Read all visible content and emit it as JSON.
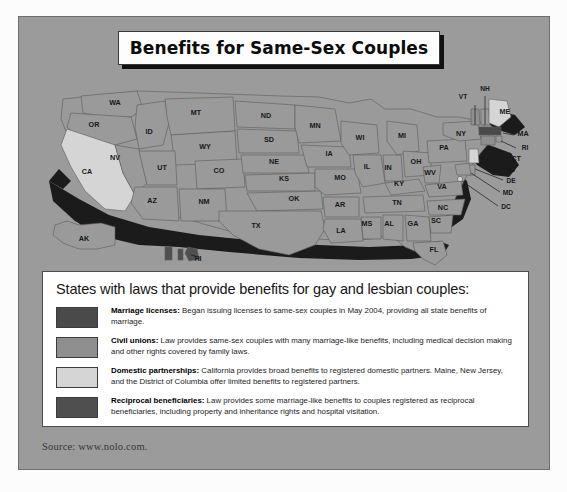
{
  "title": "Benefits for Same-Sex Couples",
  "source": "Source: www.nolo.com.",
  "colors": {
    "background": "#9b9b9b",
    "marriage": "#4a4a4a",
    "civil_union": "#8f8f8f",
    "domestic_partnership": "#d5d5d5",
    "reciprocal": "#4f4f4f",
    "default_state": "#9a9a9a",
    "shadow": "#1b1b1b",
    "border": "#4c4c4c"
  },
  "legend": {
    "heading": "States with laws that provide benefits for gay and lesbian couples:",
    "items": [
      {
        "swatch": "#4a4a4a",
        "term": "Marriage licenses:",
        "text": " Began issuing licenses to same-sex couples in May 2004, providing all state benefits of marriage."
      },
      {
        "swatch": "#8f8f8f",
        "term": "Civil unions:",
        "text": " Law provides same-sex couples with many marriage-like benefits, including medical decision making and other rights covered by family laws."
      },
      {
        "swatch": "#d5d5d5",
        "term": "Domestic partnerships:",
        "text": " California provides broad benefits to registered domestic partners. Maine, New Jersey, and the District of Columbia offer limited benefits to registered partners."
      },
      {
        "swatch": "#4f4f4f",
        "term": "Reciprocal beneficiaries:",
        "text": " Law provides some marriage-like benefits to couples registered as reciprocal beneficiaries, including property and inheritance rights and hospital visitation."
      }
    ]
  },
  "chart_data": {
    "type": "map",
    "title": "Benefits for Same-Sex Couples",
    "region": "United States",
    "legend_categories": [
      "Marriage licenses",
      "Civil unions",
      "Domestic partnerships",
      "Reciprocal beneficiaries"
    ],
    "states": [
      {
        "code": "WA",
        "category": "none"
      },
      {
        "code": "OR",
        "category": "none"
      },
      {
        "code": "CA",
        "category": "Domestic partnerships"
      },
      {
        "code": "ID",
        "category": "none"
      },
      {
        "code": "NV",
        "category": "none"
      },
      {
        "code": "MT",
        "category": "none"
      },
      {
        "code": "WY",
        "category": "none"
      },
      {
        "code": "UT",
        "category": "none"
      },
      {
        "code": "AZ",
        "category": "none"
      },
      {
        "code": "CO",
        "category": "none"
      },
      {
        "code": "NM",
        "category": "none"
      },
      {
        "code": "ND",
        "category": "none"
      },
      {
        "code": "SD",
        "category": "none"
      },
      {
        "code": "NE",
        "category": "none"
      },
      {
        "code": "KS",
        "category": "none"
      },
      {
        "code": "OK",
        "category": "none"
      },
      {
        "code": "TX",
        "category": "none"
      },
      {
        "code": "MN",
        "category": "none"
      },
      {
        "code": "IA",
        "category": "none"
      },
      {
        "code": "MO",
        "category": "none"
      },
      {
        "code": "AR",
        "category": "none"
      },
      {
        "code": "LA",
        "category": "none"
      },
      {
        "code": "WI",
        "category": "none"
      },
      {
        "code": "IL",
        "category": "none"
      },
      {
        "code": "MS",
        "category": "none"
      },
      {
        "code": "MI",
        "category": "none"
      },
      {
        "code": "IN",
        "category": "none"
      },
      {
        "code": "KY",
        "category": "none"
      },
      {
        "code": "TN",
        "category": "none"
      },
      {
        "code": "AL",
        "category": "none"
      },
      {
        "code": "GA",
        "category": "none"
      },
      {
        "code": "FL",
        "category": "none"
      },
      {
        "code": "OH",
        "category": "none"
      },
      {
        "code": "WV",
        "category": "none"
      },
      {
        "code": "VA",
        "category": "none"
      },
      {
        "code": "NC",
        "category": "none"
      },
      {
        "code": "SC",
        "category": "none"
      },
      {
        "code": "PA",
        "category": "none"
      },
      {
        "code": "NY",
        "category": "none"
      },
      {
        "code": "VT",
        "category": "Civil unions"
      },
      {
        "code": "NH",
        "category": "none"
      },
      {
        "code": "ME",
        "category": "Domestic partnerships"
      },
      {
        "code": "MA",
        "category": "Marriage licenses"
      },
      {
        "code": "RI",
        "category": "none"
      },
      {
        "code": "CT",
        "category": "Civil unions"
      },
      {
        "code": "NJ",
        "category": "Domestic partnerships"
      },
      {
        "code": "DE",
        "category": "none"
      },
      {
        "code": "MD",
        "category": "none"
      },
      {
        "code": "DC",
        "category": "Domestic partnerships"
      },
      {
        "code": "AK",
        "category": "none"
      },
      {
        "code": "HI",
        "category": "Reciprocal beneficiaries"
      }
    ]
  },
  "map_labels": [
    {
      "code": "WA",
      "x": 96,
      "y": 36
    },
    {
      "code": "OR",
      "x": 75,
      "y": 58
    },
    {
      "code": "CA",
      "x": 68,
      "y": 105
    },
    {
      "code": "ID",
      "x": 130,
      "y": 65
    },
    {
      "code": "NV",
      "x": 96,
      "y": 91
    },
    {
      "code": "MT",
      "x": 177,
      "y": 46
    },
    {
      "code": "WY",
      "x": 186,
      "y": 80
    },
    {
      "code": "UT",
      "x": 143,
      "y": 101
    },
    {
      "code": "AZ",
      "x": 133,
      "y": 134
    },
    {
      "code": "CO",
      "x": 200,
      "y": 104
    },
    {
      "code": "NM",
      "x": 185,
      "y": 135
    },
    {
      "code": "ND",
      "x": 247,
      "y": 49
    },
    {
      "code": "SD",
      "x": 250,
      "y": 73
    },
    {
      "code": "NE",
      "x": 255,
      "y": 95
    },
    {
      "code": "KS",
      "x": 265,
      "y": 112
    },
    {
      "code": "OK",
      "x": 275,
      "y": 132
    },
    {
      "code": "TX",
      "x": 237,
      "y": 159
    },
    {
      "code": "MN",
      "x": 296,
      "y": 59
    },
    {
      "code": "IA",
      "x": 310,
      "y": 87
    },
    {
      "code": "MO",
      "x": 321,
      "y": 111
    },
    {
      "code": "AR",
      "x": 321,
      "y": 138
    },
    {
      "code": "LA",
      "x": 322,
      "y": 164
    },
    {
      "code": "WI",
      "x": 341,
      "y": 71
    },
    {
      "code": "IL",
      "x": 348,
      "y": 100
    },
    {
      "code": "MS",
      "x": 348,
      "y": 157
    },
    {
      "code": "MI",
      "x": 383,
      "y": 69
    },
    {
      "code": "IN",
      "x": 369,
      "y": 101
    },
    {
      "code": "KY",
      "x": 380,
      "y": 117
    },
    {
      "code": "TN",
      "x": 378,
      "y": 136
    },
    {
      "code": "AL",
      "x": 370,
      "y": 157
    },
    {
      "code": "GA",
      "x": 394,
      "y": 157
    },
    {
      "code": "FL",
      "x": 415,
      "y": 183
    },
    {
      "code": "OH",
      "x": 397,
      "y": 95
    },
    {
      "code": "WV",
      "x": 411,
      "y": 106
    },
    {
      "code": "VA",
      "x": 423,
      "y": 120
    },
    {
      "code": "NC",
      "x": 424,
      "y": 141
    },
    {
      "code": "SC",
      "x": 417,
      "y": 154
    },
    {
      "code": "PA",
      "x": 425,
      "y": 81
    },
    {
      "code": "NY",
      "x": 442,
      "y": 67
    },
    {
      "code": "VT",
      "x": 444,
      "y": 30
    },
    {
      "code": "NH",
      "x": 466,
      "y": 22
    },
    {
      "code": "ME",
      "x": 486,
      "y": 45
    },
    {
      "code": "MA",
      "x": 504,
      "y": 67
    },
    {
      "code": "RI",
      "x": 506,
      "y": 81
    },
    {
      "code": "CT",
      "x": 497,
      "y": 92
    },
    {
      "code": "NJ",
      "x": 492,
      "y": 103
    },
    {
      "code": "DE",
      "x": 492,
      "y": 114
    },
    {
      "code": "MD",
      "x": 489,
      "y": 126
    },
    {
      "code": "DC",
      "x": 487,
      "y": 140
    },
    {
      "code": "AK",
      "x": 65,
      "y": 172
    },
    {
      "code": "HI",
      "x": 179,
      "y": 192
    }
  ]
}
